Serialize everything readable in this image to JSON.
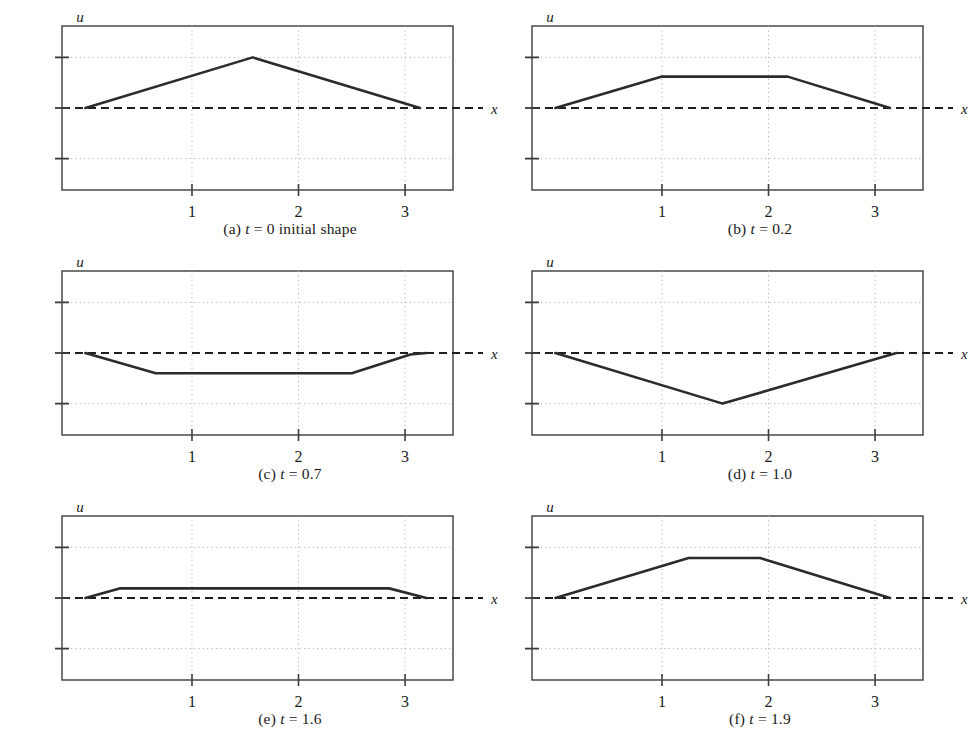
{
  "figure": {
    "kind": "multi-panel-line-plot",
    "rows": 3,
    "cols": 2,
    "panel_count": 6
  },
  "axis": {
    "y_label": "u",
    "x_label": "x",
    "x_ticks": [
      1,
      2,
      3
    ],
    "x_tick_labels": [
      "1",
      "2",
      "3"
    ],
    "y_ticks": [
      1,
      0,
      -1
    ],
    "y_tick_labels": [
      "1",
      "0",
      "−1"
    ],
    "x_range": [
      -0.22,
      3.45
    ],
    "y_range": [
      -1.62,
      1.62
    ],
    "grid": "dotted",
    "zero_line": "dashed"
  },
  "style": {
    "curve_color": "#2b2b2b",
    "frame_color": "#3c3c3c",
    "grid_color": "#b4b4b4",
    "zero_color": "#1e1e1e",
    "background": "#ffffff",
    "curve_width": 2.6
  },
  "chart_data": [
    {
      "id": "a",
      "type": "line",
      "title": "(a) t = 0 initial shape",
      "caption_prefix": "(a)",
      "caption_var": "t",
      "caption_value": "= 0 initial shape",
      "t": 0,
      "xlabel": "x",
      "ylabel": "u",
      "xlim": [
        -0.22,
        3.45
      ],
      "ylim": [
        -1.62,
        1.62
      ],
      "x": [
        0.0,
        1.57,
        3.14
      ],
      "y": [
        0.0,
        1.0,
        0.0
      ]
    },
    {
      "id": "b",
      "type": "line",
      "title": "(b) t = 0.2",
      "caption_prefix": "(b)",
      "caption_var": "t",
      "caption_value": "= 0.2",
      "t": 0.2,
      "xlabel": "x",
      "ylabel": "u",
      "xlim": [
        -0.22,
        3.45
      ],
      "ylim": [
        -1.62,
        1.62
      ],
      "x": [
        0.0,
        1.0,
        2.18,
        3.14
      ],
      "y": [
        0.0,
        0.62,
        0.62,
        0.0
      ]
    },
    {
      "id": "c",
      "type": "line",
      "title": "(c) t = 0.7",
      "caption_prefix": "(c)",
      "caption_var": "t",
      "caption_value": "= 0.7",
      "t": 0.7,
      "xlabel": "x",
      "ylabel": "u",
      "xlim": [
        -0.22,
        3.45
      ],
      "ylim": [
        -1.62,
        1.62
      ],
      "x": [
        0.0,
        0.66,
        2.5,
        3.05,
        3.2
      ],
      "y": [
        0.0,
        -0.4,
        -0.4,
        -0.03,
        0.0
      ]
    },
    {
      "id": "d",
      "type": "line",
      "title": "(d) t = 1.0",
      "caption_prefix": "(d)",
      "caption_var": "t",
      "caption_value": "= 1.0",
      "t": 1.0,
      "xlabel": "x",
      "ylabel": "u",
      "xlim": [
        -0.22,
        3.45
      ],
      "ylim": [
        -1.62,
        1.62
      ],
      "x": [
        0.0,
        1.57,
        3.2
      ],
      "y": [
        0.0,
        -1.0,
        0.0
      ]
    },
    {
      "id": "e",
      "type": "line",
      "title": "(e) t = 1.6",
      "caption_prefix": "(e)",
      "caption_var": "t",
      "caption_value": "= 1.6",
      "t": 1.6,
      "xlabel": "x",
      "ylabel": "u",
      "xlim": [
        -0.22,
        3.45
      ],
      "ylim": [
        -1.62,
        1.62
      ],
      "x": [
        0.0,
        0.32,
        2.85,
        3.2
      ],
      "y": [
        0.0,
        0.19,
        0.19,
        0.0
      ]
    },
    {
      "id": "f",
      "type": "line",
      "title": "(f) t = 1.9",
      "caption_prefix": "(f)",
      "caption_var": "t",
      "caption_value": "= 1.9",
      "t": 1.9,
      "xlabel": "x",
      "ylabel": "u",
      "xlim": [
        -0.22,
        3.45
      ],
      "ylim": [
        -1.62,
        1.62
      ],
      "x": [
        0.0,
        1.25,
        1.92,
        3.14
      ],
      "y": [
        0.0,
        0.79,
        0.79,
        0.0
      ]
    }
  ]
}
